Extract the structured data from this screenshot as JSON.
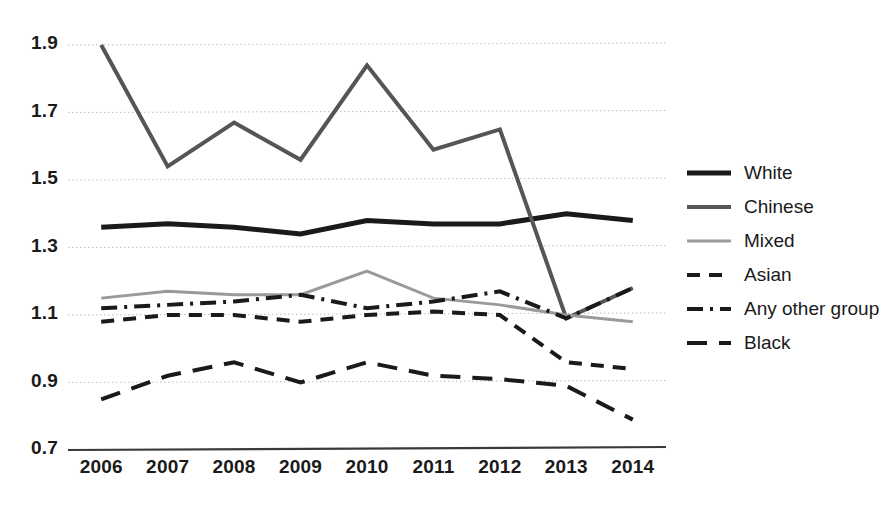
{
  "chart_data": {
    "type": "line",
    "title": "",
    "xlabel": "",
    "ylabel": "",
    "categories": [
      "2006",
      "2007",
      "2008",
      "2009",
      "2010",
      "2011",
      "2012",
      "2013",
      "2014"
    ],
    "x": [
      2006,
      2007,
      2008,
      2009,
      2010,
      2011,
      2012,
      2013,
      2014
    ],
    "ylim": [
      0.7,
      1.9
    ],
    "yticks": [
      "0.7",
      "0.9",
      "1.1",
      "1.3",
      "1.5",
      "1.7",
      "1.9"
    ],
    "ytick_values": [
      0.7,
      0.9,
      1.1,
      1.3,
      1.5,
      1.7,
      1.9
    ],
    "grid": true,
    "grid_style": "dotted-horizontal",
    "legend_position": "right",
    "series": [
      {
        "name": "White",
        "values": [
          1.36,
          1.37,
          1.36,
          1.34,
          1.38,
          1.37,
          1.37,
          1.4,
          1.38
        ],
        "color": "#1a1a1a",
        "style": "solid",
        "width": 5
      },
      {
        "name": "Chinese",
        "values": [
          1.9,
          1.54,
          1.67,
          1.56,
          1.84,
          1.59,
          1.65,
          1.09,
          1.18
        ],
        "color": "#555555",
        "style": "solid",
        "width": 4
      },
      {
        "name": "Mixed",
        "values": [
          1.15,
          1.17,
          1.16,
          1.16,
          1.23,
          1.15,
          1.13,
          1.1,
          1.08
        ],
        "color": "#9a9a9a",
        "style": "solid",
        "width": 3
      },
      {
        "name": "Asian",
        "values": [
          1.08,
          1.1,
          1.1,
          1.08,
          1.1,
          1.11,
          1.1,
          0.96,
          0.94
        ],
        "color": "#1a1a1a",
        "style": "dashed",
        "width": 4
      },
      {
        "name": "Any other group",
        "values": [
          1.12,
          1.13,
          1.14,
          1.16,
          1.12,
          1.14,
          1.17,
          1.09,
          1.18
        ],
        "color": "#1a1a1a",
        "style": "dash-dot",
        "width": 4
      },
      {
        "name": "Black",
        "values": [
          0.85,
          0.92,
          0.96,
          0.9,
          0.96,
          0.92,
          0.91,
          0.89,
          0.79
        ],
        "color": "#1a1a1a",
        "style": "long-dash",
        "width": 4
      }
    ]
  },
  "legend": {
    "items": [
      {
        "label": "White"
      },
      {
        "label": "Chinese"
      },
      {
        "label": "Mixed"
      },
      {
        "label": "Asian"
      },
      {
        "label": "Any other group"
      },
      {
        "label": "Black"
      }
    ]
  },
  "axes": {
    "y_labels": [
      "1.9",
      "1.7",
      "1.5",
      "1.3",
      "1.1",
      "0.9",
      "0.7"
    ],
    "x_labels": [
      "2006",
      "2007",
      "2008",
      "2009",
      "2010",
      "2011",
      "2012",
      "2013",
      "2014"
    ]
  },
  "colors": {
    "axis": "#3a3a3a",
    "grid": "#b8b8b8",
    "text": "#1a1a1a"
  }
}
